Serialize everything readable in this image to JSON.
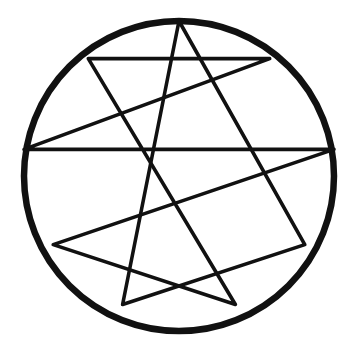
{
  "figure": {
    "name": "Enneagram",
    "background_color": "#ffffff",
    "ink_color": "#111111",
    "circle": {
      "center_x": 179,
      "center_y": 176,
      "radius": 155,
      "stroke_width": 6.5,
      "label": "outer-circle"
    },
    "points": [
      {
        "number": 1,
        "x": 88.3,
        "y": 58.6,
        "angle_deg": 230
      },
      {
        "number": 2,
        "x": 53.2,
        "y": 244.6,
        "angle_deg": 310
      },
      {
        "number": 3,
        "x": 122.6,
        "y": 304.5,
        "angle_deg": 350
      },
      {
        "number": 4,
        "x": 235.4,
        "y": 304.5,
        "angle_deg": 30
      },
      {
        "number": 5,
        "x": 304.8,
        "y": 244.6,
        "angle_deg": 70
      },
      {
        "number": 6,
        "x": 334.0,
        "y": 149.4,
        "angle_deg": 110
      },
      {
        "number": 7,
        "x": 269.7,
        "y": 58.6,
        "angle_deg": 150
      },
      {
        "number": 8,
        "x": 179.0,
        "y": 21.0,
        "angle_deg": 190
      },
      {
        "number": 9,
        "x": 24.0,
        "y": 149.4,
        "angle_deg": 270
      }
    ],
    "triangle": {
      "name": "inner-triangle",
      "vertex_point_numbers": [
        8,
        3,
        5
      ],
      "stroke_width": 3.6,
      "closed": true
    },
    "hexad": {
      "name": "inner-hexad",
      "sequence_point_numbers": [
        1,
        4,
        2,
        6,
        9,
        7
      ],
      "stroke_width": 3.6,
      "closed": true
    },
    "line_count": 9,
    "vertex_count": 9
  }
}
